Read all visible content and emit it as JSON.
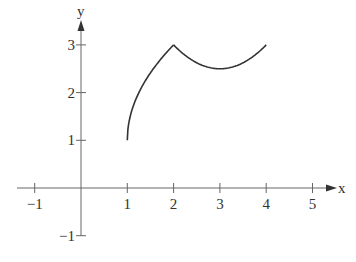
{
  "chart_data": {
    "type": "line",
    "title": "",
    "xlabel": "x",
    "ylabel": "y",
    "xlim": [
      -1.3,
      5.5
    ],
    "ylim": [
      -1.2,
      3.6
    ],
    "grid": false,
    "legend": null,
    "x_ticks": [
      -1,
      1,
      2,
      3,
      4,
      5
    ],
    "x_tick_labels": [
      "−1",
      "1",
      "2",
      "3",
      "4",
      "5"
    ],
    "y_ticks": [
      -1,
      1,
      2,
      3
    ],
    "y_tick_labels": [
      "−1",
      "1",
      "2",
      "3"
    ],
    "series": [
      {
        "name": "piece-1",
        "description": "increasing concave arc from (1,1) to (2,3)",
        "x": [
          1,
          1.05,
          1.1,
          1.2,
          1.3,
          1.4,
          1.5,
          1.6,
          1.7,
          1.8,
          1.9,
          2
        ],
        "y": [
          1,
          1.45,
          1.63,
          1.89,
          2.1,
          2.26,
          2.41,
          2.55,
          2.67,
          2.79,
          2.9,
          3
        ]
      },
      {
        "name": "piece-2",
        "description": "parabolic arc from (2,3) down to minimum near (3,2.5) and up to (4,3)",
        "x": [
          2,
          2.25,
          2.5,
          2.75,
          3,
          3.25,
          3.5,
          3.75,
          4
        ],
        "y": [
          3,
          2.78,
          2.63,
          2.53,
          2.5,
          2.53,
          2.63,
          2.78,
          3
        ]
      }
    ],
    "annotations": []
  },
  "axes": {
    "x_name": "x",
    "y_name": "y"
  }
}
